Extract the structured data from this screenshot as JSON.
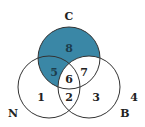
{
  "diagram": {
    "type": "venn",
    "sets": [
      {
        "name": "C",
        "label": "C"
      },
      {
        "name": "N",
        "label": "N"
      },
      {
        "name": "B",
        "label": "B"
      }
    ],
    "regions": [
      {
        "id": "1",
        "label": "1",
        "desc": "N only",
        "shaded": false
      },
      {
        "id": "2",
        "label": "2",
        "desc": "N and B only",
        "shaded": false
      },
      {
        "id": "3",
        "label": "3",
        "desc": "B only",
        "shaded": false
      },
      {
        "id": "4",
        "label": "4",
        "desc": "outside all",
        "shaded": false
      },
      {
        "id": "5",
        "label": "5",
        "desc": "C and N only",
        "shaded": true
      },
      {
        "id": "6",
        "label": "6",
        "desc": "C, N and B",
        "shaded": false
      },
      {
        "id": "7",
        "label": "7",
        "desc": "C and B only",
        "shaded": false
      },
      {
        "id": "8",
        "label": "8",
        "desc": "C only",
        "shaded": true
      }
    ],
    "colors": {
      "shade": "#3a87a6",
      "stroke": "#333333",
      "text_on_shade": "#1c3d4d",
      "text": "#222222"
    }
  }
}
